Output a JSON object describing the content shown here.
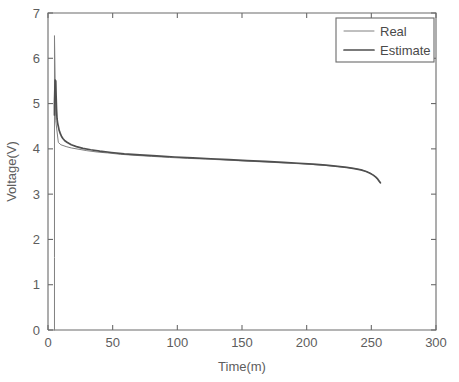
{
  "chart_data": {
    "type": "line",
    "title": "",
    "xlabel": "Time(m)",
    "ylabel": "Voltage(V)",
    "xlim": [
      0,
      300
    ],
    "ylim": [
      0,
      7
    ],
    "xticks": [
      0,
      50,
      100,
      150,
      200,
      250,
      300
    ],
    "yticks": [
      0,
      1,
      2,
      3,
      4,
      5,
      6,
      7
    ],
    "xtick_labels": [
      "0",
      "50",
      "100",
      "150",
      "200",
      "250",
      "300"
    ],
    "ytick_labels": [
      "0",
      "1",
      "2",
      "3",
      "4",
      "5",
      "6",
      "7"
    ],
    "grid": false,
    "legend_position": "upper right",
    "legend": [
      "Real",
      "Estimate"
    ],
    "colors": {
      "real": "#808080",
      "estimate": "#4f4f4f",
      "axis": "#6b6b6b",
      "text": "#5d5d5d",
      "background": "#ffffff"
    },
    "series": [
      {
        "name": "Real",
        "style": "thin",
        "x": [
          5,
          5,
          5,
          6,
          8,
          10,
          14,
          18,
          24,
          30,
          38,
          46,
          56,
          68,
          80,
          94,
          108,
          122,
          136,
          150,
          164,
          178,
          192,
          204,
          214,
          224,
          232,
          238,
          243,
          247,
          250,
          252,
          254,
          255,
          256,
          257
        ],
        "y": [
          0.0,
          1.6,
          6.5,
          4.62,
          4.14,
          4.09,
          4.05,
          4.02,
          3.99,
          3.96,
          3.93,
          3.91,
          3.88,
          3.855,
          3.835,
          3.81,
          3.79,
          3.775,
          3.755,
          3.735,
          3.715,
          3.695,
          3.675,
          3.655,
          3.635,
          3.61,
          3.585,
          3.56,
          3.53,
          3.49,
          3.45,
          3.41,
          3.36,
          3.32,
          3.28,
          3.25
        ]
      },
      {
        "name": "Estimate",
        "style": "thick",
        "x": [
          5,
          5,
          5.5,
          6,
          6.3,
          6.6,
          7,
          7.4,
          7.8,
          8.2,
          8.6,
          9,
          9.6,
          10.4,
          11.5,
          13,
          15,
          18,
          22,
          27,
          33,
          40,
          49,
          59,
          71,
          84,
          98,
          112,
          126,
          140,
          154,
          168,
          182,
          194,
          205,
          215,
          224,
          231,
          237,
          242,
          246,
          249,
          251.5,
          253.5,
          255,
          256,
          257
        ],
        "y": [
          4.75,
          5.0,
          5.52,
          5.5,
          5.15,
          4.88,
          4.66,
          4.58,
          4.52,
          4.47,
          4.41,
          4.38,
          4.33,
          4.28,
          4.23,
          4.18,
          4.14,
          4.09,
          4.05,
          4.01,
          3.98,
          3.95,
          3.92,
          3.89,
          3.865,
          3.845,
          3.82,
          3.8,
          3.782,
          3.762,
          3.742,
          3.722,
          3.702,
          3.682,
          3.662,
          3.64,
          3.615,
          3.59,
          3.565,
          3.535,
          3.5,
          3.46,
          3.42,
          3.375,
          3.33,
          3.29,
          3.25
        ]
      }
    ],
    "annotations": []
  }
}
